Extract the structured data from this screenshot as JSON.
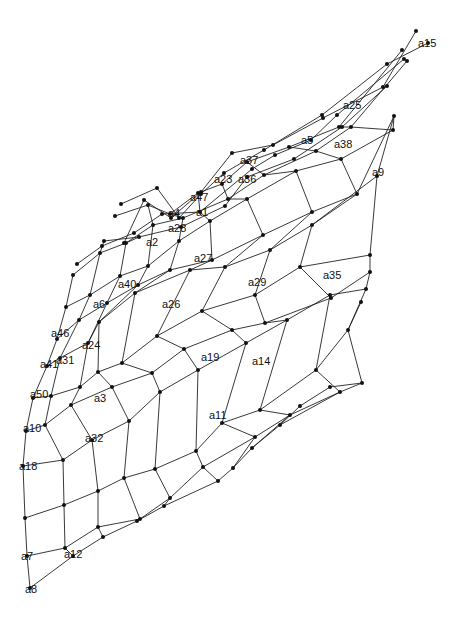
{
  "diagram": {
    "type": "deformed-grid-mesh",
    "line_color": "#222222",
    "node_color": "#111111",
    "grid_rows": [
      [
        [
          30,
          588
        ],
        [
          73,
          556
        ],
        [
          103,
          537
        ],
        [
          137,
          521
        ],
        [
          164,
          506
        ],
        [
          218,
          481
        ],
        [
          233,
          468
        ],
        [
          252,
          448
        ],
        [
          280,
          425
        ],
        [
          300,
          406
        ],
        [
          330,
          387
        ]
      ],
      [
        [
          27,
          556
        ],
        [
          65,
          548
        ],
        [
          98,
          527
        ],
        [
          140,
          519
        ],
        [
          170,
          498
        ],
        [
          203,
          467
        ],
        [
          255,
          437
        ],
        [
          290,
          415
        ],
        [
          340,
          392
        ],
        [
          362,
          383
        ]
      ],
      [
        [
          25,
          518
        ],
        [
          64,
          505
        ],
        [
          98,
          491
        ],
        [
          124,
          478
        ],
        [
          155,
          469
        ],
        [
          196,
          451
        ],
        [
          222,
          423
        ],
        [
          260,
          410
        ],
        [
          316,
          370
        ],
        [
          348,
          330
        ],
        [
          361,
          302
        ]
      ],
      [
        [
          23,
          466
        ],
        [
          63,
          460
        ],
        [
          92,
          440
        ],
        [
          129,
          421
        ],
        [
          160,
          392
        ],
        [
          198,
          370
        ],
        [
          246,
          343
        ],
        [
          287,
          320
        ],
        [
          330,
          295
        ],
        [
          366,
          289
        ]
      ],
      [
        [
          26,
          431
        ],
        [
          45,
          425
        ],
        [
          71,
          405
        ],
        [
          112,
          387
        ],
        [
          152,
          373
        ],
        [
          184,
          349
        ],
        [
          232,
          330
        ],
        [
          265,
          323
        ],
        [
          331,
          298
        ],
        [
          370,
          272
        ]
      ],
      [
        [
          33,
          398
        ],
        [
          51,
          396
        ],
        [
          80,
          387
        ],
        [
          98,
          372
        ],
        [
          122,
          363
        ],
        [
          157,
          336
        ],
        [
          202,
          311
        ],
        [
          255,
          295
        ],
        [
          300,
          267
        ],
        [
          370,
          255
        ]
      ],
      [
        [
          47,
          366
        ],
        [
          60,
          358
        ],
        [
          88,
          343
        ],
        [
          99,
          322
        ],
        [
          135,
          293
        ],
        [
          190,
          270
        ],
        [
          225,
          267
        ],
        [
          270,
          250
        ],
        [
          312,
          225
        ],
        [
          377,
          176
        ]
      ],
      [
        [
          57,
          339
        ],
        [
          79,
          320
        ],
        [
          107,
          303
        ],
        [
          138,
          285
        ],
        [
          170,
          270
        ],
        [
          212,
          260
        ],
        [
          263,
          235
        ],
        [
          312,
          212
        ],
        [
          357,
          194
        ],
        [
          394,
          116
        ]
      ],
      [
        [
          66,
          307
        ],
        [
          90,
          295
        ],
        [
          120,
          276
        ],
        [
          148,
          266
        ],
        [
          179,
          241
        ],
        [
          210,
          221
        ],
        [
          247,
          199
        ],
        [
          296,
          171
        ],
        [
          341,
          159
        ],
        [
          393,
          130
        ]
      ],
      [
        [
          73,
          275
        ],
        [
          100,
          253
        ],
        [
          126,
          243
        ],
        [
          153,
          225
        ],
        [
          183,
          218
        ],
        [
          228,
          199
        ],
        [
          264,
          175
        ],
        [
          316,
          151
        ],
        [
          351,
          127
        ],
        [
          407,
          61
        ]
      ],
      [
        [
          77,
          264
        ],
        [
          102,
          246
        ],
        [
          134,
          233
        ],
        [
          162,
          214
        ],
        [
          200,
          212
        ],
        [
          252,
          169
        ],
        [
          275,
          155
        ],
        [
          311,
          140
        ],
        [
          337,
          115
        ],
        [
          404,
          59
        ]
      ],
      [
        [
          104,
          241
        ],
        [
          139,
          237
        ],
        [
          181,
          227
        ],
        [
          225,
          206
        ],
        [
          247,
          177
        ],
        [
          294,
          159
        ],
        [
          342,
          127
        ],
        [
          387,
          86
        ]
      ],
      [
        [
          115,
          216
        ],
        [
          148,
          205
        ],
        [
          170,
          214
        ],
        [
          198,
          193
        ],
        [
          222,
          184
        ],
        [
          247,
          162
        ],
        [
          289,
          147
        ],
        [
          339,
          127
        ],
        [
          402,
          50
        ]
      ],
      [
        [
          124,
          243
        ],
        [
          144,
          200
        ],
        [
          171,
          218
        ],
        [
          201,
          192
        ],
        [
          232,
          153
        ],
        [
          273,
          145
        ],
        [
          323,
          118
        ],
        [
          383,
          87
        ],
        [
          416,
          31
        ]
      ],
      [
        [
          121,
          204
        ],
        [
          157,
          188
        ],
        [
          179,
          218
        ],
        [
          201,
          194
        ],
        [
          224,
          173
        ],
        [
          264,
          150
        ],
        [
          322,
          115
        ],
        [
          387,
          64
        ],
        [
          428,
          43
        ]
      ]
    ],
    "grid_cols": [
      [
        [
          30,
          588
        ],
        [
          27,
          556
        ],
        [
          25,
          518
        ],
        [
          23,
          466
        ],
        [
          26,
          431
        ],
        [
          33,
          398
        ],
        [
          47,
          366
        ],
        [
          57,
          339
        ],
        [
          66,
          307
        ],
        [
          73,
          275
        ]
      ],
      [
        [
          73,
          556
        ],
        [
          65,
          548
        ],
        [
          64,
          505
        ],
        [
          63,
          460
        ],
        [
          45,
          425
        ],
        [
          51,
          396
        ],
        [
          60,
          358
        ],
        [
          79,
          320
        ],
        [
          90,
          295
        ],
        [
          100,
          253
        ],
        [
          104,
          241
        ]
      ],
      [
        [
          103,
          537
        ],
        [
          98,
          527
        ],
        [
          98,
          491
        ],
        [
          92,
          440
        ],
        [
          71,
          405
        ],
        [
          80,
          387
        ],
        [
          88,
          343
        ],
        [
          107,
          303
        ],
        [
          120,
          276
        ],
        [
          126,
          243
        ],
        [
          139,
          237
        ]
      ],
      [
        [
          137,
          521
        ],
        [
          140,
          519
        ],
        [
          124,
          478
        ],
        [
          129,
          421
        ],
        [
          112,
          387
        ],
        [
          98,
          372
        ],
        [
          99,
          322
        ],
        [
          138,
          285
        ],
        [
          148,
          266
        ],
        [
          153,
          225
        ],
        [
          148,
          205
        ]
      ],
      [
        [
          164,
          506
        ],
        [
          170,
          498
        ],
        [
          155,
          469
        ],
        [
          160,
          392
        ],
        [
          152,
          373
        ],
        [
          122,
          363
        ],
        [
          135,
          293
        ],
        [
          170,
          270
        ],
        [
          179,
          241
        ],
        [
          183,
          218
        ],
        [
          170,
          214
        ]
      ],
      [
        [
          218,
          481
        ],
        [
          203,
          467
        ],
        [
          196,
          451
        ],
        [
          198,
          370
        ],
        [
          184,
          349
        ],
        [
          157,
          336
        ],
        [
          190,
          270
        ],
        [
          212,
          260
        ],
        [
          210,
          221
        ],
        [
          200,
          212
        ],
        [
          198,
          193
        ]
      ],
      [
        [
          233,
          468
        ],
        [
          255,
          437
        ],
        [
          222,
          423
        ],
        [
          246,
          343
        ],
        [
          232,
          330
        ],
        [
          202,
          311
        ],
        [
          225,
          267
        ],
        [
          263,
          235
        ],
        [
          247,
          199
        ],
        [
          228,
          199
        ],
        [
          222,
          184
        ]
      ],
      [
        [
          252,
          448
        ],
        [
          290,
          415
        ],
        [
          260,
          410
        ],
        [
          287,
          320
        ],
        [
          265,
          323
        ],
        [
          255,
          295
        ],
        [
          270,
          250
        ],
        [
          312,
          212
        ],
        [
          296,
          171
        ],
        [
          264,
          175
        ],
        [
          247,
          162
        ]
      ],
      [
        [
          280,
          425
        ],
        [
          340,
          392
        ],
        [
          316,
          370
        ],
        [
          330,
          295
        ],
        [
          331,
          298
        ],
        [
          300,
          267
        ],
        [
          312,
          225
        ],
        [
          357,
          194
        ],
        [
          341,
          159
        ],
        [
          316,
          151
        ],
        [
          289,
          147
        ]
      ],
      [
        [
          330,
          387
        ],
        [
          362,
          383
        ],
        [
          348,
          330
        ],
        [
          366,
          289
        ],
        [
          370,
          272
        ],
        [
          370,
          255
        ],
        [
          377,
          176
        ],
        [
          394,
          116
        ],
        [
          393,
          130
        ],
        [
          351,
          127
        ],
        [
          339,
          127
        ]
      ]
    ],
    "labels": [
      {
        "text": "a15",
        "x": 418,
        "y": 47
      },
      {
        "text": "a25",
        "x": 343,
        "y": 109
      },
      {
        "text": "a5",
        "x": 301,
        "y": 144
      },
      {
        "text": "a38",
        "x": 334,
        "y": 148
      },
      {
        "text": "a9",
        "x": 372,
        "y": 176
      },
      {
        "text": "a37",
        "x": 240,
        "y": 164
      },
      {
        "text": "a23",
        "x": 214,
        "y": 183
      },
      {
        "text": "a36",
        "x": 238,
        "y": 183
      },
      {
        "text": "a47",
        "x": 190,
        "y": 201
      },
      {
        "text": "a4",
        "x": 168,
        "y": 217
      },
      {
        "text": "a1",
        "x": 196,
        "y": 216
      },
      {
        "text": "a28",
        "x": 168,
        "y": 232
      },
      {
        "text": "a2",
        "x": 146,
        "y": 246
      },
      {
        "text": "a27",
        "x": 194,
        "y": 262
      },
      {
        "text": "a40",
        "x": 118,
        "y": 288
      },
      {
        "text": "a29",
        "x": 248,
        "y": 286
      },
      {
        "text": "a35",
        "x": 323,
        "y": 279
      },
      {
        "text": "a6",
        "x": 93,
        "y": 308
      },
      {
        "text": "a26",
        "x": 162,
        "y": 308
      },
      {
        "text": "a46",
        "x": 51,
        "y": 337
      },
      {
        "text": "a24",
        "x": 82,
        "y": 349
      },
      {
        "text": "a41",
        "x": 40,
        "y": 368
      },
      {
        "text": "a31",
        "x": 56,
        "y": 364
      },
      {
        "text": "a19",
        "x": 201,
        "y": 361
      },
      {
        "text": "a14",
        "x": 252,
        "y": 365
      },
      {
        "text": "a50",
        "x": 30,
        "y": 398
      },
      {
        "text": "a3",
        "x": 94,
        "y": 402
      },
      {
        "text": "a11",
        "x": 209,
        "y": 419
      },
      {
        "text": "a10",
        "x": 23,
        "y": 432
      },
      {
        "text": "a32",
        "x": 85,
        "y": 442
      },
      {
        "text": "a18",
        "x": 19,
        "y": 470
      },
      {
        "text": "a7",
        "x": 21,
        "y": 560
      },
      {
        "text": "a12",
        "x": 64,
        "y": 558
      },
      {
        "text": "a8",
        "x": 25,
        "y": 593
      }
    ]
  }
}
